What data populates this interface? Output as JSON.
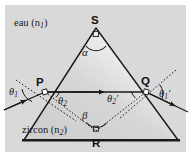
{
  "figure": {
    "kind": "optics-ray-diagram-prism",
    "caption_absent": true,
    "background_color": "#ffffff",
    "panel_color": "#d9d9d9",
    "prism_fill": "#d2d2d2",
    "prism_highlight": "#f2f2f2",
    "line_color": "#1a1a1a"
  },
  "media": {
    "upper_label": "eau (n",
    "upper_sub": "1",
    "upper_close": ")",
    "lower_label": "zircon (n",
    "lower_sub": "2",
    "lower_close": ")"
  },
  "points": {
    "apex": "S",
    "entry": "P",
    "exit": "Q",
    "base_mid": "R"
  },
  "angles": {
    "apex_angle": "α",
    "incidence": "θ",
    "incidence_sub": "1",
    "refraction": "θ",
    "refraction_sub": "2",
    "internal": "θ",
    "internal_sub": "2",
    "internal_prime": "′",
    "emergence": "θ",
    "emergence_sub": "1",
    "emergence_prime": "′",
    "deviation": "β"
  },
  "markers": {
    "right_angle_box": "square-marker",
    "apex_vertex_marker": "square-marker",
    "base_vertex_marker": "square-marker"
  }
}
